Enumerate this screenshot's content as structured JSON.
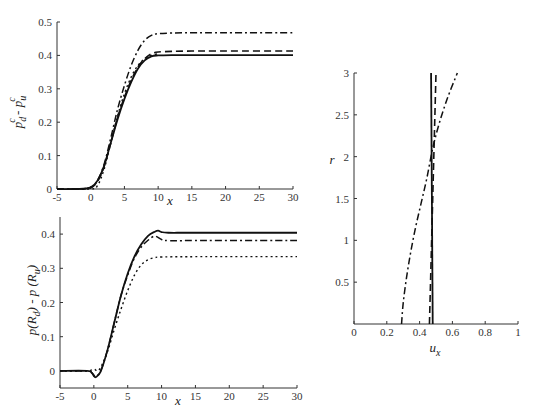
{
  "chart_data": [
    {
      "id": "top-left",
      "type": "line",
      "title": "",
      "xlabel": "x",
      "ylabel": "p_d^c - p_u^c",
      "ylabel_parts": {
        "base1": "p",
        "sub1": "d",
        "sup1": "c",
        "sep": " - ",
        "base2": "p",
        "sub2": "u",
        "sup2": "c"
      },
      "xlim": [
        -5,
        30
      ],
      "ylim": [
        0,
        0.5
      ],
      "xticks": [
        -5,
        0,
        5,
        10,
        15,
        20,
        25,
        30
      ],
      "xtick_labels": [
        "-5",
        "0",
        "5",
        "10",
        "15",
        "20",
        "25",
        "30"
      ],
      "yticks": [
        0,
        0.1,
        0.2,
        0.3,
        0.4,
        0.5
      ],
      "ytick_labels": [
        "0",
        "0.1",
        "0.2",
        "0.3",
        "0.4",
        "0.5"
      ],
      "grid": false,
      "legend": null,
      "frame": {
        "left": 57,
        "right": 293,
        "top": 22,
        "bottom": 189
      },
      "series": [
        {
          "name": "solid",
          "style": "solid",
          "x": [
            -5,
            -2,
            0,
            1,
            2,
            3,
            4,
            5,
            6,
            7,
            8,
            9,
            10,
            12,
            15,
            20,
            30
          ],
          "y": [
            0,
            0,
            0.005,
            0.025,
            0.07,
            0.14,
            0.21,
            0.27,
            0.32,
            0.36,
            0.385,
            0.397,
            0.4,
            0.401,
            0.401,
            0.401,
            0.401
          ]
        },
        {
          "name": "dashed",
          "style": "dashed",
          "x": [
            -5,
            -2,
            0,
            1,
            2,
            3,
            4,
            5,
            6,
            7,
            8,
            9,
            10,
            12,
            15,
            20,
            30
          ],
          "y": [
            0,
            0,
            0.004,
            0.022,
            0.068,
            0.14,
            0.215,
            0.275,
            0.325,
            0.365,
            0.39,
            0.405,
            0.41,
            0.412,
            0.413,
            0.413,
            0.413
          ]
        },
        {
          "name": "dotted",
          "style": "dotted",
          "x": [
            -5,
            0,
            1,
            2,
            3,
            4,
            5,
            6,
            7,
            8,
            9,
            10
          ],
          "y": [
            0,
            0,
            0.01,
            0.06,
            0.14,
            0.22,
            0.285,
            0.335,
            0.37,
            0.39,
            0.4,
            0.405
          ]
        },
        {
          "name": "dash-dot",
          "style": "dashdot",
          "x": [
            -5,
            -2,
            0,
            1,
            2,
            3,
            4,
            5,
            6,
            7,
            8,
            9,
            10,
            12,
            15,
            20,
            30
          ],
          "y": [
            0,
            0,
            0.004,
            0.025,
            0.075,
            0.155,
            0.24,
            0.31,
            0.37,
            0.415,
            0.445,
            0.46,
            0.465,
            0.467,
            0.468,
            0.468,
            0.468
          ]
        }
      ]
    },
    {
      "id": "bottom-left",
      "type": "line",
      "title": "",
      "xlabel": "x",
      "ylabel": "p(R_d) - p(R_u)",
      "ylabel_parts": {
        "a": "p(R",
        "sub1": "d",
        "b": ") - p (R",
        "sub2": "u",
        "c": ")"
      },
      "xlim": [
        -5,
        30
      ],
      "ylim": [
        -0.05,
        0.45
      ],
      "xticks": [
        -5,
        0,
        5,
        10,
        15,
        20,
        25,
        30
      ],
      "xtick_labels": [
        "-5",
        "0",
        "5",
        "10",
        "15",
        "20",
        "25",
        "30"
      ],
      "yticks": [
        0,
        0.1,
        0.2,
        0.3,
        0.4
      ],
      "ytick_labels": [
        "0",
        "0.1",
        "0.2",
        "0.3",
        "0.4"
      ],
      "grid": false,
      "legend": null,
      "frame": {
        "left": 60,
        "right": 297,
        "top": 217,
        "bottom": 388
      },
      "series": [
        {
          "name": "solid",
          "style": "solid",
          "x": [
            -5,
            -1,
            -0.3,
            0,
            0.3,
            1,
            2,
            3,
            4,
            5,
            6,
            7,
            8,
            9,
            9.5,
            10,
            11,
            15,
            30
          ],
          "y": [
            0,
            0,
            -0.006,
            -0.015,
            -0.018,
            -0.002,
            0.06,
            0.14,
            0.22,
            0.285,
            0.335,
            0.37,
            0.395,
            0.407,
            0.41,
            0.406,
            0.404,
            0.404,
            0.404
          ]
        },
        {
          "name": "dash-dot",
          "style": "dashdot",
          "x": [
            -5,
            -1,
            -0.3,
            0,
            0.3,
            1,
            2,
            3,
            4,
            5,
            6,
            7,
            8,
            9,
            10,
            11,
            15,
            30
          ],
          "y": [
            0,
            0,
            -0.005,
            -0.012,
            -0.015,
            0.0,
            0.06,
            0.14,
            0.22,
            0.28,
            0.33,
            0.362,
            0.382,
            0.394,
            0.384,
            0.381,
            0.381,
            0.381
          ]
        },
        {
          "name": "dotted",
          "style": "dotted",
          "x": [
            -5,
            -1,
            0,
            0.5,
            1,
            2,
            3,
            4,
            5,
            6,
            7,
            8,
            9,
            10,
            15,
            30
          ],
          "y": [
            0,
            0,
            0.005,
            0.0,
            0.01,
            0.055,
            0.12,
            0.18,
            0.235,
            0.28,
            0.31,
            0.325,
            0.331,
            0.333,
            0.334,
            0.334
          ]
        }
      ]
    },
    {
      "id": "right",
      "type": "line",
      "title": "",
      "xlabel": "u_x",
      "xlabel_parts": {
        "base": "u",
        "sub": "x"
      },
      "ylabel": "r",
      "xlim": [
        0,
        1
      ],
      "ylim": [
        0,
        3
      ],
      "xticks": [
        0,
        0.2,
        0.4,
        0.6,
        0.8,
        1
      ],
      "xtick_labels": [
        "0",
        "0.2",
        "0.4",
        "0.6",
        "0.8",
        "1"
      ],
      "yticks": [
        0.5,
        1,
        1.5,
        2,
        2.5,
        3
      ],
      "ytick_labels": [
        "0.5",
        "1",
        "1.5",
        "2",
        "2.5",
        "3"
      ],
      "grid": false,
      "legend": null,
      "frame": {
        "left": 354,
        "right": 518,
        "top": 73,
        "bottom": 324
      },
      "series": [
        {
          "name": "solid",
          "style": "solid",
          "x": [
            0.48,
            0.47
          ],
          "y": [
            0,
            3
          ]
        },
        {
          "name": "dashed",
          "style": "dashed",
          "x": [
            0.46,
            0.5
          ],
          "y": [
            0,
            3
          ]
        },
        {
          "name": "dash-dot",
          "style": "dashdot",
          "x": [
            0.29,
            0.3,
            0.32,
            0.345,
            0.375,
            0.41,
            0.445,
            0.48,
            0.52,
            0.57,
            0.63
          ],
          "y": [
            0,
            0.25,
            0.55,
            0.85,
            1.15,
            1.45,
            1.75,
            2.1,
            2.4,
            2.7,
            3.0
          ]
        }
      ]
    }
  ]
}
